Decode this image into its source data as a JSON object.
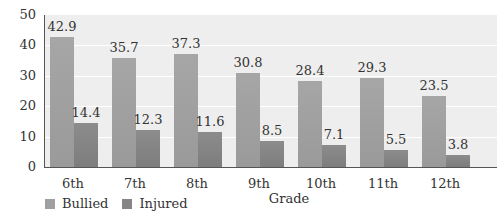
{
  "chart_data": {
    "type": "bar",
    "title": "",
    "xlabel": "Grade",
    "ylabel": "",
    "ylim": [
      0,
      50
    ],
    "yticks": [
      0,
      10,
      20,
      30,
      40,
      50
    ],
    "grid": true,
    "legend_position": "bottom-left",
    "categories": [
      "6th",
      "7th",
      "8th",
      "9th",
      "10th",
      "11th",
      "12th"
    ],
    "series": [
      {
        "name": "Bullied",
        "values": [
          42.9,
          35.7,
          37.3,
          30.8,
          28.4,
          29.3,
          23.5
        ],
        "color": "#a0a0a0"
      },
      {
        "name": "Injured",
        "values": [
          14.4,
          12.3,
          11.6,
          8.5,
          7.1,
          5.5,
          3.8
        ],
        "color": "#858585"
      }
    ]
  }
}
